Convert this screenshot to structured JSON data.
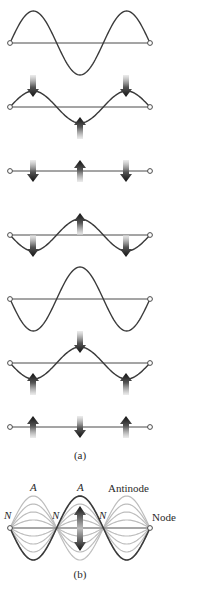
{
  "figure": {
    "width": 205,
    "height": 589,
    "colors": {
      "string": "#3a3a3a",
      "baseline": "#4a4a4a",
      "ghost": "#bdbdbd",
      "arrow_dark": "#1a1a1a",
      "arrow_light": "#d8d8d8",
      "endpoint_fill": "#ffffff"
    },
    "x_start": 10,
    "x_end": 150,
    "arrow_positions": [
      33,
      80,
      126
    ],
    "part_a": {
      "caption": "(a)",
      "caption_pos": [
        80,
        449
      ],
      "frames": [
        {
          "baseline_y": 43,
          "amplitude": 32,
          "arrows": []
        },
        {
          "baseline_y": 107,
          "amplitude": 16,
          "arrows": [
            "down",
            "up",
            "down"
          ]
        },
        {
          "baseline_y": 171,
          "amplitude": 0,
          "arrows": [
            "down",
            "up",
            "down"
          ]
        },
        {
          "baseline_y": 235,
          "amplitude": -16,
          "arrows": [
            "down",
            "up",
            "down"
          ]
        },
        {
          "baseline_y": 299,
          "amplitude": -32,
          "arrows": []
        },
        {
          "baseline_y": 363,
          "amplitude": -16,
          "arrows": [
            "up",
            "down",
            "up"
          ]
        },
        {
          "baseline_y": 427,
          "amplitude": 0,
          "arrows": [
            "up",
            "down",
            "up"
          ]
        }
      ]
    },
    "part_b": {
      "caption": "(b)",
      "caption_pos": [
        80,
        568
      ],
      "baseline_y": 528,
      "amplitude": 32,
      "ghost_fractions": [
        1,
        0.75,
        0.5,
        0.25
      ],
      "antinode_label": "A",
      "node_label": "N",
      "antinode_text": "Antinode",
      "node_text": "Node",
      "antinode_labels": [
        {
          "text": "A",
          "x": 30,
          "y": 481
        },
        {
          "text": "A",
          "x": 77,
          "y": 481
        }
      ],
      "node_labels": [
        {
          "text": "N",
          "x": 4,
          "y": 509
        },
        {
          "text": "N",
          "x": 52,
          "y": 509
        },
        {
          "text": "N",
          "x": 99,
          "y": 509
        }
      ],
      "antinode_callout": {
        "text": "Antinode",
        "x": 108,
        "y": 482
      },
      "node_callout": {
        "text": "Node",
        "x": 152,
        "y": 511
      },
      "double_arrow": {
        "x": 80,
        "top": 506,
        "bottom": 551
      }
    }
  }
}
